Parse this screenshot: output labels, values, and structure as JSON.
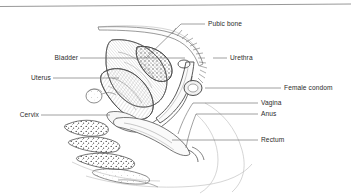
{
  "figure": {
    "type": "anatomical-line-diagram",
    "background_color": "#ffffff",
    "ink_color": "#3a3a3a",
    "label_color": "#2b2b2b",
    "leader_line_color": "#6e6e6e",
    "top_rule": {
      "present": true,
      "color": "#8c8c8c",
      "y_left": 6,
      "y_right": 4
    }
  },
  "labels": [
    {
      "id": "pubic-bone",
      "text": "Pubic bone",
      "side": "right",
      "text_x": 208,
      "text_y": 20,
      "leader": {
        "x1": 181,
        "y1": 24,
        "x2": 205,
        "y2": 24
      },
      "pointer": {
        "x1": 181,
        "y1": 24,
        "x2": 146,
        "y2": 57
      }
    },
    {
      "id": "bladder",
      "text": "Bladder",
      "side": "left",
      "text_x": 50,
      "text_y": 54,
      "leader": {
        "x1": 80,
        "y1": 58,
        "x2": 185,
        "y2": 58
      }
    },
    {
      "id": "urethra",
      "text": "Urethra",
      "side": "right",
      "text_x": 230,
      "text_y": 54,
      "leader": {
        "x1": 213,
        "y1": 58,
        "x2": 227,
        "y2": 58
      }
    },
    {
      "id": "uterus",
      "text": "Uterus",
      "side": "left",
      "text_x": 26,
      "text_y": 74,
      "leader": {
        "x1": 53,
        "y1": 78,
        "x2": 119,
        "y2": 78
      }
    },
    {
      "id": "female-condom",
      "text": "Female condom",
      "side": "right",
      "text_x": 284,
      "text_y": 84,
      "leader": {
        "x1": 205,
        "y1": 88,
        "x2": 281,
        "y2": 88
      }
    },
    {
      "id": "vagina",
      "text": "Vagina",
      "side": "right",
      "text_x": 261,
      "text_y": 99,
      "leader": {
        "x1": 193,
        "y1": 103,
        "x2": 258,
        "y2": 103
      }
    },
    {
      "id": "anus",
      "text": "Anus",
      "side": "right",
      "text_x": 261,
      "text_y": 110,
      "leader": {
        "x1": 196,
        "y1": 114,
        "x2": 258,
        "y2": 114
      }
    },
    {
      "id": "cervix",
      "text": "Cervix",
      "side": "left",
      "text_x": 16,
      "text_y": 111,
      "leader": {
        "x1": 41,
        "y1": 115,
        "x2": 110,
        "y2": 115
      }
    },
    {
      "id": "rectum",
      "text": "Rectum",
      "side": "right",
      "text_x": 261,
      "text_y": 136,
      "leader": {
        "x1": 172,
        "y1": 140,
        "x2": 258,
        "y2": 140
      }
    }
  ],
  "anatomy_parts": [
    {
      "id": "abdominal-wall",
      "name": "abdominal wall contour"
    },
    {
      "id": "pubic-bone-body",
      "name": "pubic bone (stippled)"
    },
    {
      "id": "bladder-body",
      "name": "urinary bladder"
    },
    {
      "id": "uterus-body",
      "name": "uterus (hatched)"
    },
    {
      "id": "ovary",
      "name": "ovary"
    },
    {
      "id": "cervix-body",
      "name": "cervix"
    },
    {
      "id": "vaginal-canal",
      "name": "vaginal canal"
    },
    {
      "id": "condom-sheath",
      "name": "female condom sheath"
    },
    {
      "id": "condom-outer-ring",
      "name": "female condom outer ring"
    },
    {
      "id": "condom-inner-ring",
      "name": "female condom inner ring"
    },
    {
      "id": "rectum-body",
      "name": "rectum"
    },
    {
      "id": "anus-body",
      "name": "anus"
    },
    {
      "id": "sacrum",
      "name": "sacrum and coccyx vertebrae (stippled)"
    },
    {
      "id": "buttock-contour",
      "name": "buttock and thigh contour"
    }
  ]
}
